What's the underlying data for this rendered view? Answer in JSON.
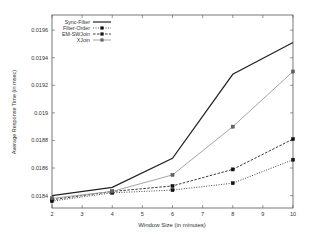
{
  "chart_data": {
    "type": "line",
    "title": "",
    "xlabel": "Window Size (in minutes)",
    "ylabel": "Average Response Time (in msec)",
    "x": [
      2,
      4,
      6,
      8,
      10
    ],
    "xlim": [
      2,
      10
    ],
    "ylim": [
      0.01831,
      0.01971
    ],
    "xticks": [
      2,
      3,
      4,
      5,
      6,
      7,
      8,
      9,
      10
    ],
    "yticks": [
      0.0184,
      0.0186,
      0.0188,
      0.019,
      0.0192,
      0.0194,
      0.0196
    ],
    "ytick_labels": [
      "0.0184",
      "0.0186",
      "0.0188",
      "0.019",
      "0.0192",
      "0.0194",
      "0.0196"
    ],
    "grid": false,
    "legend_position": "top-left",
    "series": [
      {
        "name": "Sync-Filter",
        "values": [
          0.0184,
          0.01846,
          0.01867,
          0.01928,
          0.01951
        ],
        "color": "#222222",
        "style": "solid",
        "marker": "none"
      },
      {
        "name": "Filter-Order",
        "values": [
          0.01836,
          0.01842,
          0.01844,
          0.01849,
          0.01866
        ],
        "color": "#333333",
        "style": "dotted",
        "marker": "square"
      },
      {
        "name": "EM-SWJoin",
        "values": [
          0.01837,
          0.01843,
          0.01847,
          0.01859,
          0.01881
        ],
        "color": "#222222",
        "style": "dashed",
        "marker": "square"
      },
      {
        "name": "XJoin",
        "values": [
          0.01838,
          0.01843,
          0.01855,
          0.0189,
          0.0193
        ],
        "color": "#9a9a9a",
        "style": "solid",
        "marker": "square"
      }
    ]
  }
}
